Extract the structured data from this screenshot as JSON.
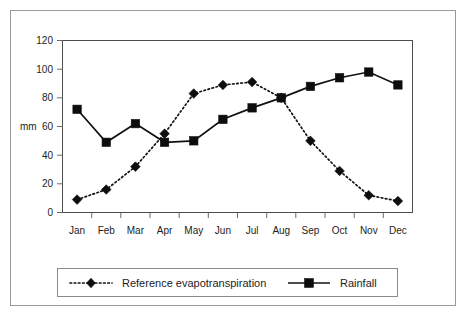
{
  "chart_data": {
    "type": "line",
    "title": "",
    "xlabel": "",
    "ylabel": "mm",
    "ylim": [
      0,
      120
    ],
    "ytick_step": 20,
    "yticks": [
      "0",
      "20",
      "40",
      "60",
      "80",
      "100",
      "120"
    ],
    "grid": false,
    "legend_position": "bottom",
    "categories": [
      "Jan",
      "Feb",
      "Mar",
      "Apr",
      "May",
      "Jun",
      "Jul",
      "Aug",
      "Sep",
      "Oct",
      "Nov",
      "Dec"
    ],
    "series": [
      {
        "name": "Reference evapotranspiration",
        "marker": "diamond",
        "line_style": "dotted",
        "color": "#0d0d0d",
        "values": [
          9,
          16,
          32,
          55,
          83,
          89,
          91,
          80,
          50,
          29,
          12,
          8
        ]
      },
      {
        "name": "Rainfall",
        "marker": "square",
        "line_style": "solid",
        "color": "#0d0d0d",
        "values": [
          72,
          49,
          62,
          49,
          50,
          65,
          73,
          80,
          88,
          94,
          98,
          89
        ]
      }
    ]
  },
  "axis": {
    "y_title": "mm"
  },
  "legend": {
    "entries": [
      {
        "label": "Reference evapotranspiration"
      },
      {
        "label": "Rainfall"
      }
    ]
  },
  "caption": {
    "sliver_text": ""
  }
}
